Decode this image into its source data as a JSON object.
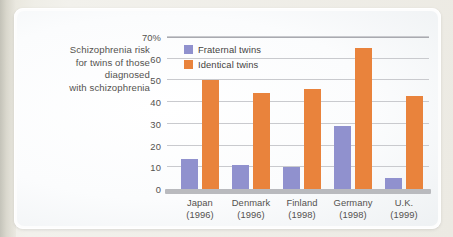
{
  "caption": {
    "lines": [
      "Schizophrenia risk",
      "for twins of those",
      "diagnosed",
      "with schizophrenia"
    ]
  },
  "legend": {
    "items": [
      {
        "label": "Fraternal twins",
        "color": "#9091ce",
        "key": "fraternal"
      },
      {
        "label": "Identical twins",
        "color": "#e9833c",
        "key": "identical"
      }
    ]
  },
  "axis": {
    "y_ticks": [
      "70%",
      "60",
      "50",
      "40",
      "30",
      "20",
      "10",
      "0"
    ],
    "x_labels": [
      {
        "country": "Japan",
        "year": "(1996)"
      },
      {
        "country": "Denmark",
        "year": "(1996)"
      },
      {
        "country": "Finland",
        "year": "(1998)"
      },
      {
        "country": "Germany",
        "year": "(1998)"
      },
      {
        "country": "U.K.",
        "year": "(1999)"
      }
    ]
  },
  "colors": {
    "fraternal": "#9091ce",
    "identical": "#e9833c",
    "gridline": "#c9cace",
    "axis_band": "#b9babe",
    "text": "#54524f",
    "card_background": "#fdfdfd",
    "page_background": "#eceae3"
  },
  "chart_data": {
    "type": "bar",
    "title": "Schizophrenia risk for twins of those diagnosed with schizophrenia",
    "xlabel": "",
    "ylabel": "",
    "ylim": [
      0,
      70
    ],
    "yticks": [
      0,
      10,
      20,
      30,
      40,
      50,
      60,
      70
    ],
    "y_unit": "%",
    "grid": true,
    "legend_position": "top-left inside plot",
    "categories": [
      "Japan (1996)",
      "Denmark (1996)",
      "Finland (1998)",
      "Germany (1998)",
      "U.K. (1999)"
    ],
    "series": [
      {
        "name": "Fraternal twins",
        "color": "#9091ce",
        "values": [
          14,
          11,
          10,
          29,
          5
        ]
      },
      {
        "name": "Identical twins",
        "color": "#e9833c",
        "values": [
          50,
          44,
          46,
          65,
          43
        ]
      }
    ]
  }
}
